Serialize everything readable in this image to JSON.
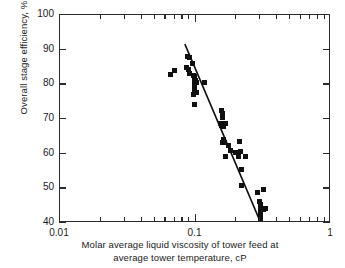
{
  "chart_data": {
    "type": "scatter",
    "title": "",
    "xlabel": "Molar average liquid viscosity of tower feed at average tower temperature, cP",
    "xlabel_line1": "Molar average liquid viscosity of tower feed at",
    "xlabel_line2": "average tower temperature, cP",
    "ylabel": "Overall stage efficiency, %",
    "xscale": "log",
    "yscale": "linear",
    "xlim": [
      0.01,
      1
    ],
    "ylim": [
      40,
      100
    ],
    "grid": false,
    "legend": null,
    "x_tick_labels": [
      "0.01",
      "0.1",
      "1"
    ],
    "x_tick_values": [
      0.01,
      0.1,
      1
    ],
    "x_minor_ticks": [
      0.02,
      0.03,
      0.04,
      0.05,
      0.06,
      0.07,
      0.08,
      0.09,
      0.2,
      0.3,
      0.4,
      0.5,
      0.6,
      0.7,
      0.8,
      0.9
    ],
    "y_tick_labels": [
      "40",
      "50",
      "60",
      "70",
      "80",
      "90",
      "100"
    ],
    "y_tick_values": [
      40,
      50,
      60,
      70,
      80,
      90,
      100
    ],
    "marker": "square",
    "marker_color": "#101010",
    "axis_color": "#2b2b2b",
    "points": [
      [
        0.0655,
        82.8
      ],
      [
        0.07,
        83.9
      ],
      [
        0.088,
        88.0
      ],
      [
        0.0905,
        87.6
      ],
      [
        0.086,
        85.0
      ],
      [
        0.0885,
        84.2
      ],
      [
        0.0955,
        86.0
      ],
      [
        0.0905,
        83.2
      ],
      [
        0.096,
        82.6
      ],
      [
        0.0985,
        82.4
      ],
      [
        0.0975,
        81.5
      ],
      [
        0.1,
        81.2
      ],
      [
        0.101,
        80.6
      ],
      [
        0.0985,
        80.0
      ],
      [
        0.0985,
        78.4
      ],
      [
        0.0965,
        77.2
      ],
      [
        0.101,
        77.6
      ],
      [
        0.117,
        80.5
      ],
      [
        0.0985,
        74.1
      ],
      [
        0.156,
        72.4
      ],
      [
        0.159,
        71.6
      ],
      [
        0.158,
        70.3
      ],
      [
        0.154,
        68.6
      ],
      [
        0.159,
        68.7
      ],
      [
        0.162,
        68.6
      ],
      [
        0.166,
        68.7
      ],
      [
        0.155,
        68.0
      ],
      [
        0.16,
        67.9
      ],
      [
        0.162,
        64.2
      ],
      [
        0.164,
        63.3
      ],
      [
        0.157,
        63.2
      ],
      [
        0.176,
        62.4
      ],
      [
        0.21,
        63.4
      ],
      [
        0.181,
        61.0
      ],
      [
        0.216,
        60.5
      ],
      [
        0.196,
        60.2
      ],
      [
        0.208,
        59.2
      ],
      [
        0.167,
        59.2
      ],
      [
        0.233,
        59.2
      ],
      [
        0.217,
        55.3
      ],
      [
        0.217,
        50.9
      ],
      [
        0.32,
        49.8
      ],
      [
        0.286,
        48.9
      ],
      [
        0.298,
        46.2
      ],
      [
        0.301,
        45.4
      ],
      [
        0.3,
        44.1
      ],
      [
        0.316,
        44.0
      ],
      [
        0.326,
        44.1
      ],
      [
        0.3,
        43.0
      ],
      [
        0.301,
        41.9
      ],
      [
        0.3,
        40.7
      ]
    ],
    "trendline": {
      "x_start": 0.0835,
      "y_start": 91.6,
      "x_end": 0.293,
      "y_end": 41.4,
      "color": "#101010",
      "width_px": 1.6
    }
  }
}
